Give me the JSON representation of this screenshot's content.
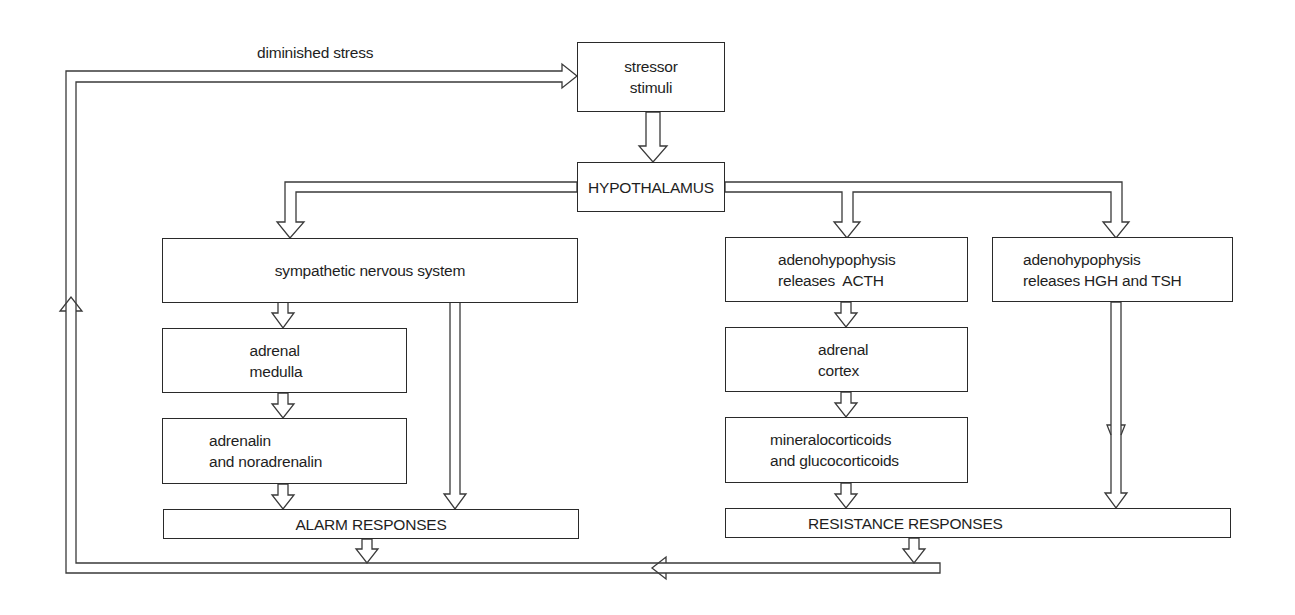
{
  "diagram": {
    "feedback_label": "diminished stress",
    "nodes": {
      "stressor": {
        "lines": [
          "stressor",
          "stimuli"
        ]
      },
      "hypothalamus": {
        "lines": [
          "HYPOTHALAMUS"
        ]
      },
      "sympathetic": {
        "lines": [
          "sympathetic nervous system"
        ]
      },
      "adrenal_medulla": {
        "lines": [
          "adrenal",
          "medulla"
        ]
      },
      "adrenalin": {
        "lines": [
          "adrenalin",
          "and noradrenalin"
        ]
      },
      "alarm": {
        "lines": [
          "ALARM RESPONSES"
        ]
      },
      "acth": {
        "lines": [
          "adenohypophysis",
          "releases  ACTH"
        ]
      },
      "adrenal_cortex": {
        "lines": [
          "adrenal",
          "cortex"
        ]
      },
      "corticoids": {
        "lines": [
          "mineralocorticoids",
          "and glucocorticoids"
        ]
      },
      "hgh_tsh": {
        "lines": [
          "adenohypophysis",
          "releases HGH and TSH"
        ]
      },
      "resistance": {
        "lines": [
          "RESISTANCE RESPONSES"
        ]
      }
    },
    "edges": [
      {
        "from": "stressor",
        "to": "hypothalamus"
      },
      {
        "from": "hypothalamus",
        "to": "sympathetic"
      },
      {
        "from": "hypothalamus",
        "to": "acth"
      },
      {
        "from": "hypothalamus",
        "to": "hgh_tsh"
      },
      {
        "from": "sympathetic",
        "to": "adrenal_medulla"
      },
      {
        "from": "sympathetic",
        "to": "alarm"
      },
      {
        "from": "adrenal_medulla",
        "to": "adrenalin"
      },
      {
        "from": "adrenalin",
        "to": "alarm"
      },
      {
        "from": "acth",
        "to": "adrenal_cortex"
      },
      {
        "from": "adrenal_cortex",
        "to": "corticoids"
      },
      {
        "from": "corticoids",
        "to": "resistance"
      },
      {
        "from": "hgh_tsh",
        "to": "resistance"
      },
      {
        "from": "alarm",
        "to": "stressor",
        "label": "diminished stress"
      },
      {
        "from": "resistance",
        "to": "stressor",
        "label": "diminished stress"
      }
    ],
    "colors": {
      "line": "#2a2a2a",
      "background": "#ffffff"
    }
  }
}
